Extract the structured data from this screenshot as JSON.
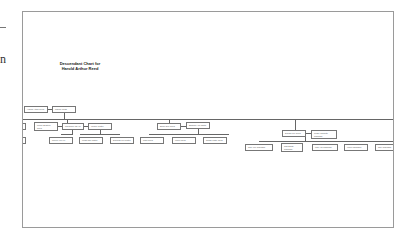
{
  "edge": {
    "char": "n"
  },
  "chart": {
    "title_line1": "Descendant Chart for",
    "title_line2": "Harold Arthur Reed",
    "root": {
      "person": "Harold Arthur Reed",
      "spouse": "Marion Webb"
    },
    "generation2": [
      {
        "person": "Lucille Beatrice Reed",
        "spouse": "Raymond Ass Hill",
        "spouse2": "Wesley Gutter"
      },
      {
        "person": "Bruce Dee Reed",
        "spouse": "Barbara Ann Martin"
      },
      {
        "person": "Donald Lee Reed",
        "spouse": "Peggy Jeanette Robinson"
      }
    ],
    "generation3": [
      {
        "label": "Melvin Ann Hill"
      },
      {
        "label": "Linda Mae Gutter"
      },
      {
        "label": "Deborah Lee Gutter"
      },
      {
        "label": "Mark Reed"
      },
      {
        "label": "Karen Reed"
      },
      {
        "label": "Susan Kathy Reed"
      },
      {
        "label": "Gary Lee Robinson"
      },
      {
        "label": "Carla Beth Robinson"
      },
      {
        "label": "Lisa Ann Robinson"
      },
      {
        "label": "Karen Robinson"
      },
      {
        "label": "Tony Robinson"
      }
    ]
  }
}
